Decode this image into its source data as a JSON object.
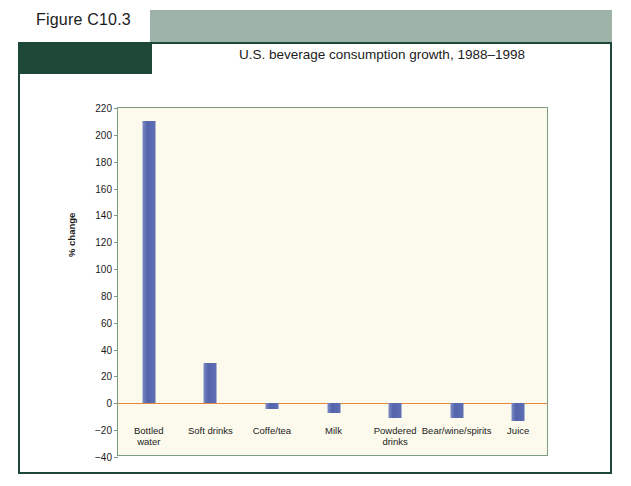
{
  "figure": {
    "label": "Figure C10.3"
  },
  "colors": {
    "sage_bar": "#9eb3a7",
    "dark_block": "#1d4838",
    "frame_border": "#1d4838",
    "plot_background": "#fcfaec",
    "plot_border": "#7d9c7d",
    "bar_fill": "#5464ac",
    "zero_line": "#e8873c",
    "text": "#1b1b1b"
  },
  "chart_data": {
    "type": "bar",
    "title": "U.S. beverage consumption growth, 1988–1998",
    "xlabel": "",
    "ylabel": "% change",
    "ylim": [
      -40,
      220
    ],
    "ytick_step": 20,
    "yticks": [
      "220",
      "200",
      "180",
      "160",
      "140",
      "120",
      "100",
      "80",
      "60",
      "40",
      "20",
      "0",
      "−20",
      "−40"
    ],
    "ytick_values": [
      220,
      200,
      180,
      160,
      140,
      120,
      100,
      80,
      60,
      40,
      20,
      0,
      -20,
      -40
    ],
    "grid": false,
    "legend": false,
    "zero_line": true,
    "categories": [
      "Bottled water",
      "Soft drinks",
      "Coffe/tea",
      "Milk",
      "Powdered drinks",
      "Bear/wine/spirits",
      "Juice"
    ],
    "category_lines": [
      [
        "Bottled",
        "water"
      ],
      [
        "Soft drinks"
      ],
      [
        "Coffe/tea"
      ],
      [
        "Milk"
      ],
      [
        "Powdered",
        "drinks"
      ],
      [
        "Bear/wine/spirits"
      ],
      [
        "Juice"
      ]
    ],
    "values": [
      210,
      30,
      -4,
      -7,
      -11,
      -11,
      -13
    ]
  }
}
